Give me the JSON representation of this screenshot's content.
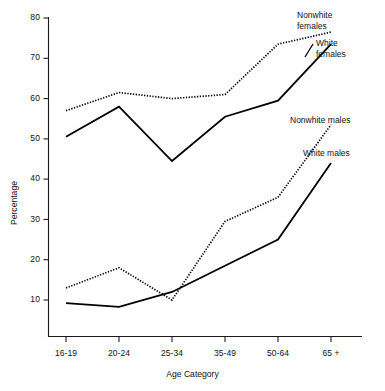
{
  "chart_data": {
    "type": "line",
    "title": "",
    "xlabel": "Age Category",
    "ylabel": "Percentage",
    "categories": [
      "16-19",
      "20-24",
      "25-34",
      "35-49",
      "50-64",
      "65 +"
    ],
    "ylim": [
      0,
      80
    ],
    "yticks": [
      10,
      20,
      30,
      40,
      50,
      60,
      70,
      80
    ],
    "grid": false,
    "legend_position": "right-inline-annotations",
    "series": [
      {
        "name": "Nonwhite females",
        "style": "dotted",
        "values": [
          57,
          61.5,
          60,
          61,
          73.5,
          76.5
        ]
      },
      {
        "name": "White females",
        "style": "solid",
        "values": [
          50.5,
          58,
          44.5,
          55.5,
          59.5,
          73.5
        ]
      },
      {
        "name": "Nonwhite males",
        "style": "dotted",
        "values": [
          13,
          18,
          10,
          29.5,
          35.5,
          53.5
        ]
      },
      {
        "name": "White males",
        "style": "solid",
        "values": [
          9.2,
          8.3,
          12,
          18.5,
          25,
          44
        ]
      }
    ]
  },
  "annotations": {
    "nonwhite_females": "Nonwhite\nfemales",
    "nonwhite_females_line1": "Nonwhite",
    "nonwhite_females_line2": "females",
    "white_females_line1": "White",
    "white_females_line2": "females",
    "nonwhite_males": "Nonwhite males",
    "white_males": "White males"
  },
  "axes": {
    "y_title": "Percentage",
    "x_title": "Age Category",
    "y_tick_labels": [
      "80",
      "70",
      "60",
      "50",
      "40",
      "30",
      "20",
      "10"
    ],
    "x_tick_labels": [
      "16-19",
      "20-24",
      "25-34",
      "35-49",
      "50-64",
      "65 +"
    ]
  },
  "colors": {
    "ink": "#000000",
    "background": "#ffffff"
  }
}
